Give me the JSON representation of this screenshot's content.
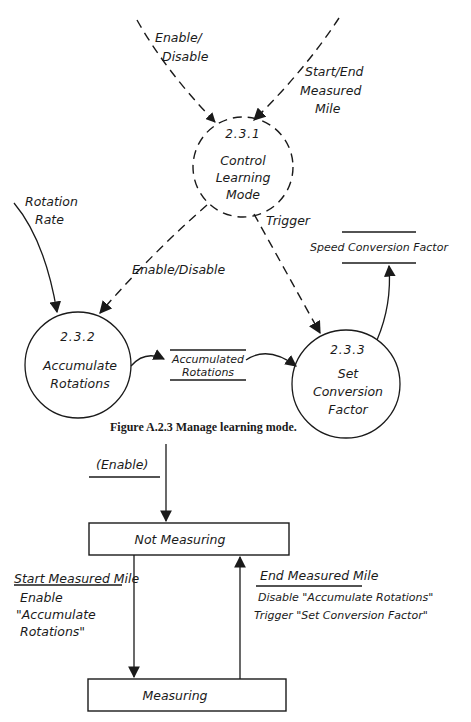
{
  "dataflow_diagram": {
    "processes": [
      {
        "id": "2.3.1",
        "name_line1": "Control",
        "name_line2": "Learning",
        "name_line3": "Mode",
        "type": "control"
      },
      {
        "id": "2.3.2",
        "name_line1": "Accumulate",
        "name_line2": "Rotations",
        "type": "data"
      },
      {
        "id": "2.3.3",
        "name_line1": "Set",
        "name_line2": "Conversion",
        "name_line3": "Factor",
        "type": "data"
      }
    ],
    "stores": {
      "accumulated_rotations_line1": "Accumulated",
      "accumulated_rotations_line2": "Rotations",
      "speed_conversion_factor": "Speed Conversion Factor"
    },
    "flows": {
      "enable_disable_in_line1": "Enable/",
      "enable_disable_in_line2": "Disable",
      "start_end_line1": "Start/End",
      "start_end_line2": "Measured",
      "start_end_line3": "Mile",
      "rotation_rate_line1": "Rotation",
      "rotation_rate_line2": "Rate",
      "enable_disable_out": "Enable/Disable",
      "trigger": "Trigger"
    },
    "caption": "Figure A.2.3  Manage learning mode."
  },
  "state_diagram": {
    "initial_event": "(Enable)",
    "states": {
      "not_measuring": "Not Measuring",
      "measuring": "Measuring"
    },
    "transitions": {
      "start": {
        "condition": "Start Measured Mile",
        "action_line1": "Enable",
        "action_line2": "\"Accumulate",
        "action_line3": "Rotations\""
      },
      "end": {
        "condition": "End Measured Mile",
        "action_line1": "Disable \"Accumulate Rotations\"",
        "action_line2": "Trigger \"Set Conversion Factor\""
      }
    }
  }
}
